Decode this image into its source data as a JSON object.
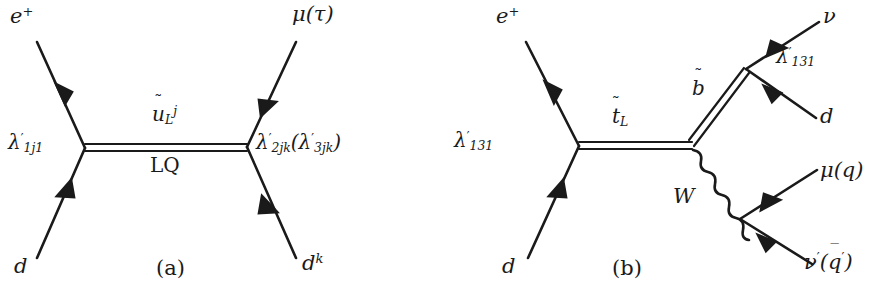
{
  "figure": {
    "background": "#ffffff",
    "ink": "#1a1a1a",
    "width": 887,
    "height": 298
  },
  "diagram_a": {
    "caption": "(a)",
    "incoming_top": "e",
    "incoming_top_sup": "+",
    "incoming_bottom": "d",
    "outgoing_top": "μ(τ)",
    "outgoing_bottom": "d",
    "outgoing_bottom_sup": "k",
    "vertex_left_coupling": "λ",
    "vertex_left_prime": "′",
    "vertex_left_sub": "1j1",
    "vertex_right_coupling": "λ",
    "vertex_right_prime": "′",
    "vertex_right_sub": "2jk",
    "vertex_right_paren_open": "(",
    "vertex_right_alt_coupling": "λ",
    "vertex_right_alt_prime": "′",
    "vertex_right_alt_sub": "3jk",
    "vertex_right_paren_close": ")",
    "propagator_symbol": "u",
    "propagator_tilde": "˜",
    "propagator_sub": "L",
    "propagator_sup": "j",
    "propagator_name": "LQ"
  },
  "diagram_b": {
    "caption": "(b)",
    "incoming_top": "e",
    "incoming_top_sup": "+",
    "incoming_bottom": "d",
    "vertex_left_coupling": "λ",
    "vertex_left_prime": "′",
    "vertex_left_sub": "131",
    "propagator_stop_symbol": "t",
    "propagator_stop_tilde": "˜",
    "propagator_stop_sub": "L",
    "propagator_sbottom_symbol": "b",
    "propagator_sbottom_tilde": "˜",
    "vertex_right_coupling": "λ",
    "vertex_right_prime": "′",
    "vertex_right_sub": "131",
    "outgoing_neutrino": "ν",
    "outgoing_down": "d",
    "boson_label": "W",
    "outgoing_muon": "μ(q)",
    "outgoing_nu_prime": "ν",
    "outgoing_nu_prime_mark": "′",
    "outgoing_nu_prime_paren_open": "(",
    "outgoing_qbar_symbol": "q",
    "outgoing_qbar_mark": "‾",
    "outgoing_qbar_prime": "′",
    "outgoing_nu_prime_paren_close": ")"
  },
  "icons": {
    "fermion_arrow": "arrow-head-icon",
    "double_line": "scalar-propagator-icon",
    "wavy_line": "boson-propagator-icon"
  }
}
